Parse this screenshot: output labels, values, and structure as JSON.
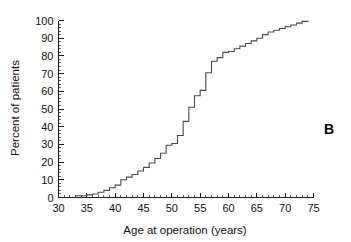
{
  "figure": {
    "panel_label": "B",
    "background_color": "#ffffff",
    "curve_color": "#4a4a4a",
    "axis_color": "#1a1a1a"
  },
  "chart_data": {
    "type": "line",
    "subtype": "step-cumulative-distribution",
    "title": "",
    "xlabel": "Age at operation (years)",
    "ylabel": "Percent of patients",
    "xlim": [
      30,
      75
    ],
    "ylim": [
      0,
      100
    ],
    "grid": false,
    "legend": null,
    "xticks": [
      30,
      35,
      40,
      45,
      50,
      55,
      60,
      65,
      70,
      75
    ],
    "xtick_labels": [
      "30",
      "35",
      "40",
      "45",
      "50",
      "55",
      "60",
      "65",
      "70",
      "75"
    ],
    "x_minor_tick_step": 1,
    "yticks": [
      0,
      10,
      20,
      30,
      40,
      50,
      60,
      70,
      80,
      90,
      100
    ],
    "ytick_labels": [
      "0",
      "10",
      "20",
      "30",
      "40",
      "50",
      "60",
      "70",
      "80",
      "90",
      "100"
    ],
    "y_minor_tick_step": 2,
    "series": [
      {
        "name": "Cumulative percent of patients",
        "x": [
          33.0,
          34.0,
          35.0,
          36.0,
          37.0,
          38.0,
          39.0,
          40.0,
          41.0,
          42.0,
          43.0,
          44.0,
          45.0,
          46.0,
          47.0,
          48.0,
          49.0,
          50.0,
          51.0,
          52.0,
          53.0,
          54.0,
          55.0,
          56.0,
          57.0,
          58.0,
          59.0,
          60.0,
          61.0,
          62.0,
          63.0,
          64.0,
          65.0,
          66.0,
          67.0,
          68.0,
          69.0,
          70.0,
          71.0,
          72.0,
          73.0,
          74.0
        ],
        "values": [
          1.0,
          1.0,
          1.5,
          2.0,
          3.0,
          4.0,
          5.5,
          7.0,
          10.0,
          11.5,
          13.0,
          15.0,
          17.0,
          19.5,
          22.0,
          25.0,
          29.5,
          30.5,
          35.0,
          43.0,
          51.0,
          57.5,
          60.5,
          70.5,
          77.0,
          79.0,
          82.0,
          82.5,
          84.0,
          85.5,
          87.0,
          88.5,
          90.0,
          92.0,
          93.5,
          94.5,
          95.5,
          96.5,
          97.5,
          98.5,
          99.5,
          100.0
        ]
      }
    ]
  }
}
